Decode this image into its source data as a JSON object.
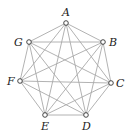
{
  "diagram": {
    "type": "complete-graph",
    "name": "K7",
    "vertices": [
      {
        "id": "A",
        "label": "A",
        "x": 66,
        "y": 23,
        "lx": 62,
        "ly": 16
      },
      {
        "id": "B",
        "label": "B",
        "x": 103,
        "y": 42,
        "lx": 109,
        "ly": 46
      },
      {
        "id": "C",
        "label": "C",
        "x": 111,
        "y": 83,
        "lx": 116,
        "ly": 87
      },
      {
        "id": "D",
        "label": "D",
        "x": 86,
        "y": 115,
        "lx": 82,
        "ly": 130
      },
      {
        "id": "E",
        "label": "E",
        "x": 45,
        "y": 115,
        "lx": 41,
        "ly": 130
      },
      {
        "id": "F",
        "label": "F",
        "x": 20,
        "y": 81,
        "lx": 7,
        "ly": 85
      },
      {
        "id": "G",
        "label": "G",
        "x": 29,
        "y": 42,
        "lx": 14,
        "ly": 46
      }
    ],
    "edges": [
      [
        "A",
        "B"
      ],
      [
        "A",
        "C"
      ],
      [
        "A",
        "D"
      ],
      [
        "A",
        "E"
      ],
      [
        "A",
        "F"
      ],
      [
        "A",
        "G"
      ],
      [
        "B",
        "C"
      ],
      [
        "B",
        "D"
      ],
      [
        "B",
        "E"
      ],
      [
        "B",
        "F"
      ],
      [
        "B",
        "G"
      ],
      [
        "C",
        "D"
      ],
      [
        "C",
        "E"
      ],
      [
        "C",
        "F"
      ],
      [
        "C",
        "G"
      ],
      [
        "D",
        "E"
      ],
      [
        "D",
        "F"
      ],
      [
        "D",
        "G"
      ],
      [
        "E",
        "F"
      ],
      [
        "E",
        "G"
      ],
      [
        "F",
        "G"
      ]
    ],
    "colors": {
      "edge": "#a9a9a9",
      "node_stroke": "#333333",
      "label": "#222222"
    }
  }
}
